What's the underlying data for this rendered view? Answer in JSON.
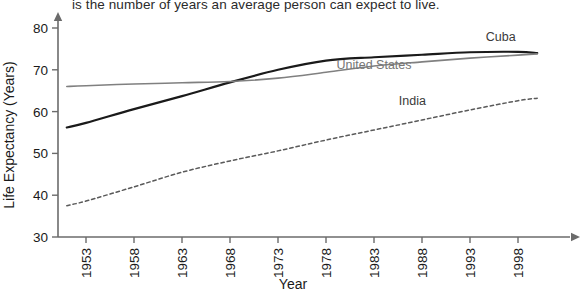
{
  "caption": {
    "text": "is the number of years an average person can expect to live."
  },
  "chart_data": {
    "type": "line",
    "title": "",
    "xlabel": "Year",
    "ylabel": "Life Expectancy (Years)",
    "xlim": [
      1951,
      2000
    ],
    "ylim": [
      30,
      82
    ],
    "xticks": [
      1953,
      1958,
      1963,
      1968,
      1973,
      1978,
      1983,
      1988,
      1993,
      1998
    ],
    "xtick_labels": [
      "1953",
      "1958",
      "1963",
      "1968",
      "1973",
      "1978",
      "1983",
      "1988",
      "1993",
      "1998"
    ],
    "yticks": [
      30,
      40,
      50,
      60,
      70,
      80
    ],
    "ytick_labels": [
      "30",
      "40",
      "50",
      "60",
      "70",
      "80"
    ],
    "grid": false,
    "legend": "inline-labels",
    "series": [
      {
        "name": "Cuba",
        "color": "#1a1a1a",
        "style": "solid",
        "width": 2.2,
        "label_x": 1996.2,
        "label_y": 77.0,
        "x": [
          1951,
          1953,
          1958,
          1963,
          1968,
          1973,
          1978,
          1983,
          1988,
          1993,
          1998,
          2000
        ],
        "y": [
          56.2,
          57.3,
          60.6,
          63.7,
          67.0,
          70.0,
          72.2,
          73.0,
          73.6,
          74.2,
          74.3,
          74.0
        ]
      },
      {
        "name": "United States",
        "color": "#808080",
        "style": "solid",
        "width": 1.6,
        "label_x": 1983.0,
        "label_y": 70.2,
        "x": [
          1951,
          1953,
          1958,
          1963,
          1968,
          1973,
          1978,
          1983,
          1988,
          1993,
          1998,
          2000
        ],
        "y": [
          66.0,
          66.2,
          66.6,
          66.9,
          67.2,
          68.0,
          69.4,
          70.9,
          71.9,
          72.8,
          73.5,
          73.8
        ]
      },
      {
        "name": "India",
        "color": "#5a5a5a",
        "style": "dashed",
        "width": 1.5,
        "label_x": 1987.0,
        "label_y": 61.5,
        "x": [
          1951,
          1953,
          1958,
          1963,
          1968,
          1973,
          1978,
          1983,
          1988,
          1993,
          1998,
          2000
        ],
        "y": [
          37.5,
          38.6,
          42.0,
          45.5,
          48.2,
          50.6,
          53.2,
          55.6,
          58.0,
          60.4,
          62.6,
          63.2
        ]
      }
    ]
  },
  "axes": {
    "x_arrow": true,
    "y_arrow": true
  }
}
